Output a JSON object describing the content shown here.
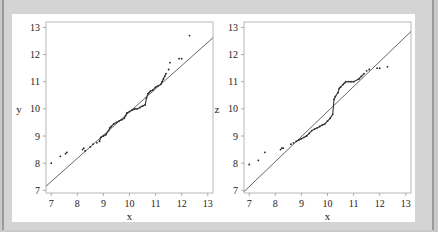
{
  "chart_data": [
    {
      "type": "scatter",
      "title": "",
      "xlabel": "x",
      "ylabel": "y",
      "xlim": [
        6.8,
        13.2
      ],
      "ylim": [
        6.9,
        13.2
      ],
      "xticks": [
        7,
        8,
        9,
        10,
        11,
        12,
        13
      ],
      "yticks": [
        7,
        8,
        9,
        10,
        11,
        12,
        13
      ],
      "grid": false,
      "legend": null,
      "reference_line": {
        "x": [
          6.8,
          13.2
        ],
        "y": [
          7.15,
          12.62
        ]
      },
      "points": {
        "x": [
          7.0,
          7.35,
          7.55,
          7.6,
          8.2,
          8.25,
          8.3,
          8.5,
          8.6,
          8.75,
          8.85,
          8.9,
          9.0,
          9.1,
          9.2,
          9.25,
          9.3,
          9.4,
          9.5,
          9.6,
          9.7,
          9.8,
          9.85,
          9.9,
          10.0,
          10.1,
          10.2,
          10.3,
          10.4,
          10.5,
          10.6,
          10.65,
          10.7,
          10.75,
          10.8,
          10.9,
          11.0,
          11.1,
          11.2,
          11.25,
          11.3,
          11.35,
          11.4,
          11.5,
          11.55,
          11.9,
          12.0,
          12.3
        ],
        "y": [
          8.0,
          8.25,
          8.35,
          8.4,
          8.5,
          8.55,
          8.45,
          8.6,
          8.7,
          8.75,
          8.8,
          8.95,
          9.0,
          9.05,
          9.2,
          9.3,
          9.35,
          9.45,
          9.5,
          9.55,
          9.6,
          9.65,
          9.75,
          9.85,
          9.9,
          9.95,
          10.0,
          10.0,
          10.05,
          10.1,
          10.15,
          10.4,
          10.55,
          10.6,
          10.65,
          10.7,
          10.8,
          10.85,
          10.9,
          11.0,
          11.1,
          11.2,
          11.3,
          11.45,
          11.7,
          11.85,
          11.85,
          12.7
        ]
      }
    },
    {
      "type": "scatter",
      "title": "",
      "xlabel": "x",
      "ylabel": "z",
      "xlim": [
        6.8,
        13.2
      ],
      "ylim": [
        6.9,
        13.2
      ],
      "xticks": [
        7,
        8,
        9,
        10,
        11,
        12,
        13
      ],
      "yticks": [
        7,
        8,
        9,
        10,
        11,
        12,
        13
      ],
      "grid": false,
      "legend": null,
      "reference_line": {
        "x": [
          6.8,
          13.2
        ],
        "y": [
          6.95,
          12.85
        ]
      },
      "points": {
        "x": [
          7.0,
          7.35,
          7.6,
          8.2,
          8.25,
          8.3,
          8.6,
          8.7,
          8.8,
          8.9,
          9.0,
          9.1,
          9.2,
          9.3,
          9.4,
          9.5,
          9.6,
          9.7,
          9.8,
          9.9,
          10.0,
          10.1,
          10.2,
          10.25,
          10.3,
          10.4,
          10.45,
          10.5,
          10.6,
          10.65,
          10.7,
          10.8,
          10.9,
          11.0,
          11.2,
          11.3,
          11.4,
          11.5,
          11.6,
          11.9,
          12.0,
          12.3
        ],
        "y": [
          7.95,
          8.1,
          8.4,
          8.5,
          8.55,
          8.55,
          8.7,
          8.75,
          8.8,
          8.85,
          8.9,
          8.95,
          9.0,
          9.1,
          9.2,
          9.25,
          9.3,
          9.35,
          9.4,
          9.45,
          9.55,
          9.65,
          9.8,
          10.35,
          10.45,
          10.6,
          10.75,
          10.8,
          10.9,
          10.95,
          11.0,
          11.0,
          11.0,
          11.0,
          11.1,
          11.2,
          11.3,
          11.4,
          11.45,
          11.5,
          11.5,
          11.55
        ]
      }
    }
  ],
  "plots": {
    "left": {
      "xlabel": "x",
      "ylabel": "y",
      "ticks": [
        "7",
        "8",
        "9",
        "10",
        "11",
        "12",
        "13"
      ]
    },
    "right": {
      "xlabel": "x",
      "ylabel": "z",
      "ticks": [
        "7",
        "8",
        "9",
        "10",
        "11",
        "12",
        "13"
      ]
    }
  }
}
